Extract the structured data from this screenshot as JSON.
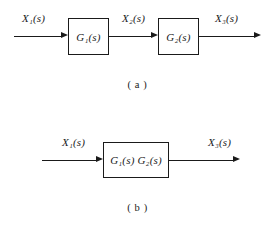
{
  "figure": {
    "background_color": "#ffffff",
    "ink_color": "#1a1a1a",
    "diagrams": [
      {
        "id": "diagram-a",
        "caption": "( a )",
        "description": "two blocks in cascade",
        "input_label": "X₁(s)",
        "intermediate_label": "X₂(s)",
        "output_label": "X₃(s)",
        "blocks": [
          {
            "id": "block-g1",
            "label": "G₁(s)"
          },
          {
            "id": "block-g2",
            "label": "G₂(s)"
          }
        ]
      },
      {
        "id": "diagram-b",
        "caption": "( b )",
        "description": "single equivalent block",
        "input_label": "X₁(s)",
        "output_label": "X₃(s)",
        "blocks": [
          {
            "id": "block-g1g2",
            "label": "G₁(s) G₂(s)"
          }
        ]
      }
    ]
  }
}
